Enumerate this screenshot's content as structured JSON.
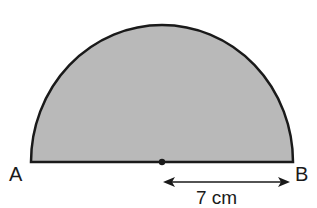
{
  "diagram": {
    "shape": "semicircle",
    "fill_color": "#b9b9b9",
    "stroke_color": "#1a1a1a",
    "labels": {
      "left_endpoint": "A",
      "right_endpoint": "B",
      "radius": "7 cm"
    },
    "center_marker": "dot"
  }
}
